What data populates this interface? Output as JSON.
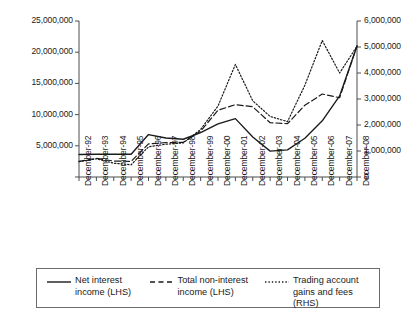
{
  "chart_data": {
    "type": "line",
    "title": "",
    "subtitle": "",
    "xlabel": "",
    "ylabel": "",
    "grid": false,
    "legend_position": "bottom",
    "dual_axis": true,
    "categories": [
      "December-92",
      "December-93",
      "December-94",
      "December-95",
      "December-96",
      "December-97",
      "December-98",
      "December-99",
      "December-00",
      "December-01",
      "December-02",
      "December-03",
      "December-04",
      "December-05",
      "December-06",
      "December-07",
      "December-08"
    ],
    "left_axis": {
      "label": "LHS",
      "ylim": [
        0,
        25000000
      ],
      "ticks": [
        0,
        5000000,
        10000000,
        15000000,
        20000000,
        25000000
      ],
      "tick_labels": [
        "0",
        "5,000,000",
        "10,000,000",
        "15,000,000",
        "20,000,000",
        "25,000,000"
      ]
    },
    "right_axis": {
      "label": "RHS",
      "ylim": [
        0,
        6000000
      ],
      "ticks": [
        0,
        1000000,
        2000000,
        3000000,
        4000000,
        5000000,
        6000000
      ],
      "tick_labels": [
        "0",
        "1,000,000",
        "2,000,000",
        "3,000,000",
        "4,000,000",
        "5,000,000",
        "6,000,000"
      ]
    },
    "series": [
      {
        "name": "Net interest income (LHS)",
        "legend_label": "Net interest\nincome (LHS)",
        "axis": "left",
        "style": "solid",
        "color": "#1a1a1a",
        "values": [
          3600000,
          3650000,
          3650000,
          3650000,
          6800000,
          6250000,
          6050000,
          7100000,
          8500000,
          9350000,
          6400000,
          4150000,
          4350000,
          6200000,
          9000000,
          13000000,
          21000000
        ]
      },
      {
        "name": "Total non-interest income (LHS)",
        "legend_label": "Total non-interest\nincome (LHS)",
        "axis": "left",
        "style": "dashed",
        "color": "#1a1a1a",
        "values": [
          2500000,
          3000000,
          2550000,
          2500000,
          5300000,
          5500000,
          5550000,
          7350000,
          10700000,
          11600000,
          11250000,
          8700000,
          8550000,
          11500000,
          13300000,
          12700000,
          21000000
        ]
      },
      {
        "name": "Trading account gains and fees (RHS)",
        "legend_label": "Trading account\ngains and fees (RHS)",
        "axis": "right",
        "style": "dotted",
        "color": "#1a1a1a",
        "values": [
          590000,
          700000,
          530000,
          470000,
          1160000,
          1260000,
          1310000,
          1830000,
          2730000,
          4330000,
          2930000,
          2330000,
          2130000,
          3530000,
          5250000,
          4000000,
          5030000
        ]
      }
    ]
  },
  "legend": {
    "items": [
      {
        "label": "Net interest\nincome (LHS)",
        "style": "solid"
      },
      {
        "label": "Total non-interest\nincome (LHS)",
        "style": "dashed"
      },
      {
        "label": "Trading account\ngains and fees (RHS)",
        "style": "dotted"
      }
    ]
  }
}
